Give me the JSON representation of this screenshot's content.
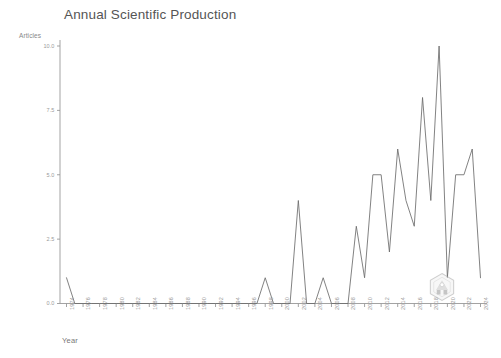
{
  "chart_data": {
    "type": "line",
    "title": "Annual Scientific Production",
    "xlabel": "Year",
    "ylabel": "Articles",
    "grid": false,
    "legend": null,
    "xlim": [
      1974,
      2024
    ],
    "ylim": [
      0.0,
      10.0
    ],
    "yticks": [
      0.0,
      2.5,
      5.0,
      7.5,
      10.0
    ],
    "ytick_labels": [
      "0.0",
      "2.5",
      "5.0",
      "7.5",
      "10.0"
    ],
    "categories": [
      "1974",
      "1975",
      "1976",
      "1977",
      "1978",
      "1979",
      "1980",
      "1981",
      "1982",
      "1983",
      "1984",
      "1985",
      "1986",
      "1987",
      "1988",
      "1989",
      "1990",
      "1991",
      "1992",
      "1993",
      "1994",
      "1995",
      "1996",
      "1997",
      "1998",
      "1999",
      "2000",
      "2001",
      "2002",
      "2003",
      "2004",
      "2005",
      "2006",
      "2007",
      "2008",
      "2009",
      "2010",
      "2011",
      "2012",
      "2013",
      "2014",
      "2015",
      "2016",
      "2017",
      "2018",
      "2019",
      "2020",
      "2021",
      "2022",
      "2023",
      "2024"
    ],
    "xtick_labels": [
      "1974",
      "1976",
      "1978",
      "1980",
      "1982",
      "1984",
      "1986",
      "1988",
      "1990",
      "1992",
      "1994",
      "1996",
      "1998",
      "2000",
      "2002",
      "2004",
      "2006",
      "2008",
      "2010",
      "2012",
      "2014",
      "2016",
      "2018",
      "2020",
      "2022",
      "2024"
    ],
    "values": [
      1,
      0,
      0,
      0,
      0,
      0,
      0,
      0,
      0,
      0,
      0,
      0,
      0,
      0,
      0,
      0,
      0,
      0,
      0,
      0,
      0,
      0,
      0,
      0,
      1,
      0,
      0,
      0,
      4,
      0,
      0,
      1,
      0,
      0,
      0,
      3,
      1,
      5,
      5,
      2,
      6,
      4,
      3,
      8,
      4,
      10,
      1,
      5,
      5,
      6,
      1
    ],
    "series_color": "#6b6b6b",
    "axis_color": "#999999",
    "annotations": [
      {
        "name": "logo-watermark",
        "type": "hexagon-logo"
      }
    ]
  }
}
